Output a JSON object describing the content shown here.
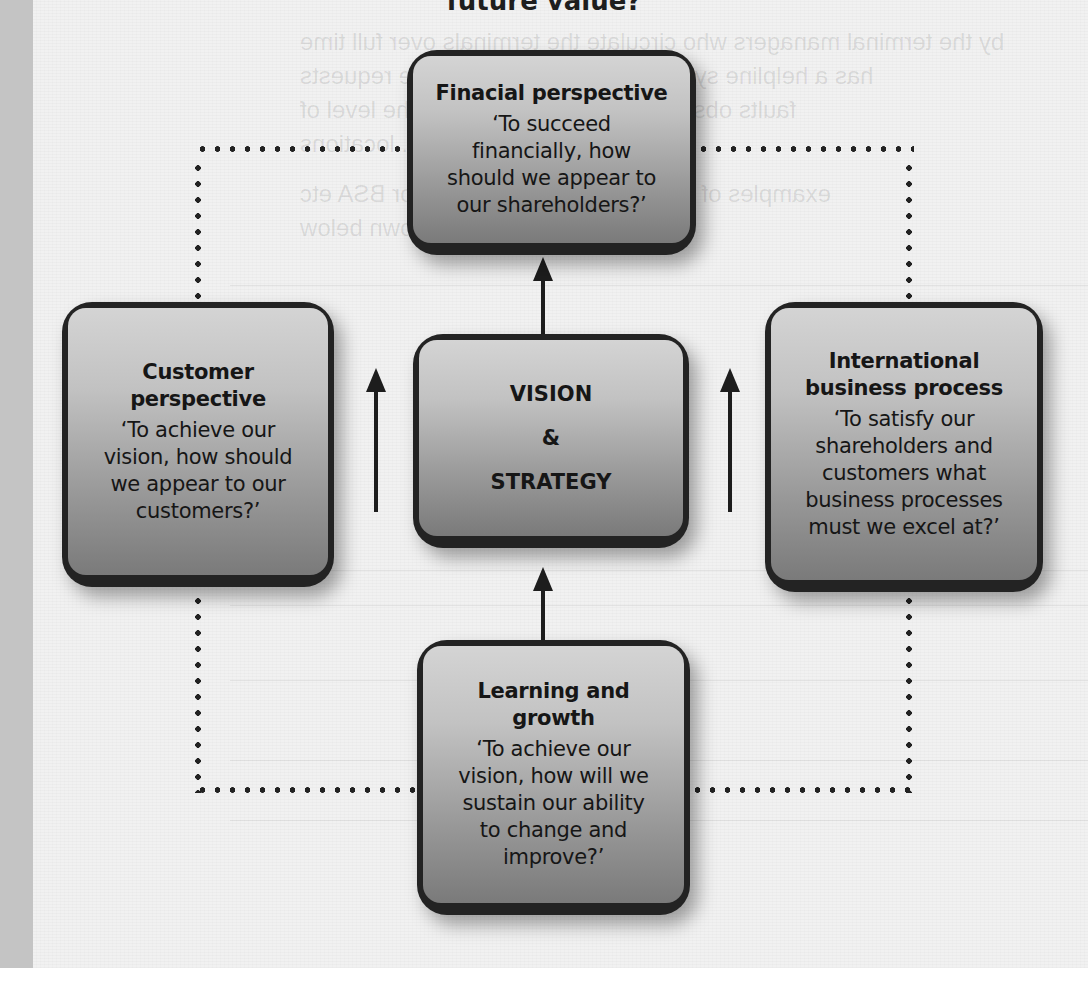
{
  "header_fragment": "future value?",
  "diagram": {
    "type": "balanced-scorecard",
    "center": {
      "line1": "VISION",
      "line2": "&",
      "line3": "STRATEGY"
    },
    "boxes": {
      "top": {
        "title": "Finacial perspective",
        "quote_lines": [
          "‘To succeed",
          "financially, how",
          "should we appear to",
          "our shareholders?’"
        ]
      },
      "left": {
        "title_lines": [
          "Customer",
          "perspective"
        ],
        "quote_lines": [
          "‘To achieve our",
          "vision, how should",
          "we appear to our",
          "customers?’"
        ]
      },
      "right": {
        "title_lines": [
          "International",
          "business process"
        ],
        "quote_lines": [
          "‘To satisfy our",
          "shareholders and",
          "customers what",
          "business processes",
          "must we excel at?’"
        ]
      },
      "bottom": {
        "title_lines": [
          "Learning and",
          "growth"
        ],
        "quote_lines": [
          "‘To achieve our",
          "vision, how will we",
          "sustain our ability",
          "to change and",
          "improve?’"
        ]
      }
    },
    "connectors": {
      "arrows": [
        "center-to-top",
        "bottom-to-center",
        "left-side-up",
        "right-side-up"
      ],
      "dotted_loop": "top-left-bottom-right rectangle linking outer perspectives"
    }
  },
  "colors": {
    "frame": "#232323",
    "fill_top": "#d4d4d4",
    "fill_bottom": "#7a7a7a",
    "page": "#f1f1f1",
    "gutter": "#c4c4c4"
  }
}
